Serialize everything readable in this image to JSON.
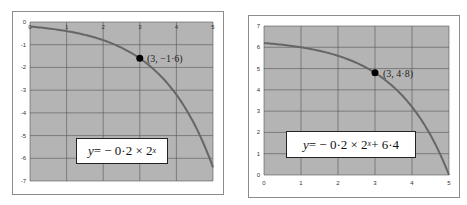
{
  "chart_data": [
    {
      "type": "line",
      "title": "",
      "xlabel": "",
      "ylabel": "",
      "x_ticks": [
        "0",
        "1",
        "2",
        "3",
        "4",
        "5"
      ],
      "y_ticks": [
        "0",
        "-1",
        "-2",
        "-3",
        "-4",
        "-5",
        "-6",
        "-7"
      ],
      "xlim": [
        0,
        5
      ],
      "ylim": [
        -7,
        0
      ],
      "x_axis_position": "top",
      "grid": true,
      "series": [
        {
          "name": "y = -0.2 × 2^x",
          "x": [
            0,
            0.5,
            1,
            1.5,
            2,
            2.5,
            3,
            3.5,
            4,
            4.5,
            5
          ],
          "y": [
            -0.2,
            -0.28,
            -0.4,
            -0.57,
            -0.8,
            -1.13,
            -1.6,
            -2.26,
            -3.2,
            -4.53,
            -6.4
          ]
        }
      ],
      "annotations": [
        {
          "type": "point",
          "x": 3,
          "y": -1.6,
          "label": "(3, −1·6)"
        },
        {
          "type": "equation_box",
          "text": "y = − 0·2 × 2^x"
        }
      ],
      "colors": {
        "plot_bg": "#b4b4b4",
        "curve": "#666666",
        "grid": "#555555",
        "point": "#000000"
      }
    },
    {
      "type": "line",
      "title": "",
      "xlabel": "",
      "ylabel": "",
      "x_ticks": [
        "0",
        "1",
        "2",
        "3",
        "4",
        "5"
      ],
      "y_ticks": [
        "0",
        "1",
        "2",
        "3",
        "4",
        "5",
        "6",
        "7"
      ],
      "xlim": [
        0,
        5
      ],
      "ylim": [
        0,
        7
      ],
      "x_axis_position": "bottom",
      "grid": true,
      "series": [
        {
          "name": "y = -0.2 × 2^x + 6.4",
          "x": [
            0,
            0.5,
            1,
            1.5,
            2,
            2.5,
            3,
            3.5,
            4,
            4.5,
            5
          ],
          "y": [
            6.2,
            6.12,
            6.0,
            5.83,
            5.6,
            5.27,
            4.8,
            4.14,
            3.2,
            1.87,
            0.0
          ]
        }
      ],
      "annotations": [
        {
          "type": "point",
          "x": 3,
          "y": 4.8,
          "label": "(3, 4·8)"
        },
        {
          "type": "equation_box",
          "text": "y = − 0·2 × 2^x + 6·4"
        }
      ],
      "colors": {
        "plot_bg": "#b4b4b4",
        "curve": "#666666",
        "grid": "#555555",
        "point": "#000000"
      }
    }
  ],
  "left_chart": {
    "point_label": "(3, −1·6)",
    "equation": {
      "y": "y",
      "rest": " = − 0·2 × 2",
      "exp": "x",
      "tail": ""
    }
  },
  "right_chart": {
    "point_label": "(3, 4·8)",
    "equation": {
      "y": "y",
      "rest": " = − 0·2 × 2",
      "exp": "x",
      "tail": " + 6·4"
    }
  }
}
